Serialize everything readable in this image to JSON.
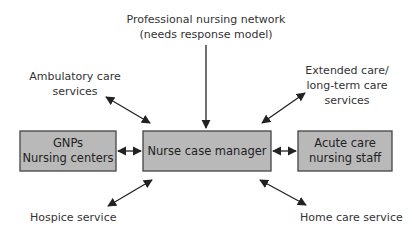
{
  "diagram": {
    "colors": {
      "box_fill": "#b9b9b9",
      "box_stroke": "#444444",
      "arrow": "#222222",
      "text": "#333333"
    },
    "center_node": {
      "id": "nurse-case-manager",
      "lines": [
        "Nurse case manager"
      ]
    },
    "box_nodes": [
      {
        "id": "gnps-nursing-centers",
        "lines": [
          "GNPs",
          "Nursing centers"
        ]
      },
      {
        "id": "acute-care-nursing-staff",
        "lines": [
          "Acute care",
          "nursing staff"
        ]
      }
    ],
    "label_nodes": [
      {
        "id": "professional-nursing-network",
        "lines": [
          "Professional nursing network",
          "(needs response model)"
        ]
      },
      {
        "id": "ambulatory-care-services",
        "lines": [
          "Ambulatory care",
          "services"
        ]
      },
      {
        "id": "extended-long-term-care",
        "lines": [
          "Extended care/",
          "long-term care",
          "services"
        ]
      },
      {
        "id": "hospice-service",
        "lines": [
          "Hospice service"
        ]
      },
      {
        "id": "home-care-service",
        "lines": [
          "Home care service"
        ]
      }
    ],
    "edges": [
      {
        "from": "professional-nursing-network",
        "to": "nurse-case-manager",
        "direction": "one-way"
      },
      {
        "from": "ambulatory-care-services",
        "to": "nurse-case-manager",
        "direction": "two-way"
      },
      {
        "from": "extended-long-term-care",
        "to": "nurse-case-manager",
        "direction": "two-way"
      },
      {
        "from": "gnps-nursing-centers",
        "to": "nurse-case-manager",
        "direction": "two-way"
      },
      {
        "from": "acute-care-nursing-staff",
        "to": "nurse-case-manager",
        "direction": "two-way"
      },
      {
        "from": "hospice-service",
        "to": "nurse-case-manager",
        "direction": "two-way"
      },
      {
        "from": "home-care-service",
        "to": "nurse-case-manager",
        "direction": "two-way"
      }
    ]
  }
}
